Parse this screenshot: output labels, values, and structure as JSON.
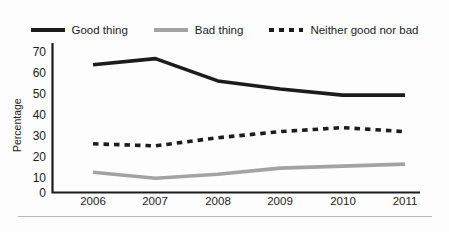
{
  "chart_data": {
    "type": "line",
    "title": "",
    "subtitle": "",
    "xlabel": "",
    "ylabel": "Percentage",
    "categories": [
      "2006",
      "2007",
      "2008",
      "2009",
      "2010",
      "2011"
    ],
    "x": [
      2006,
      2007,
      2008,
      2009,
      2010,
      2011
    ],
    "ylim": [
      0,
      70
    ],
    "xlim": [
      2006,
      2011
    ],
    "yticks": [
      0,
      10,
      20,
      30,
      40,
      50,
      60,
      70
    ],
    "ytick_labels": [
      "0",
      "10",
      "20",
      "30",
      "40",
      "50",
      "60",
      "70"
    ],
    "grid": false,
    "legend_position": "top",
    "series": [
      {
        "name": "Good thing",
        "values": [
          63,
          66,
          55,
          51,
          48,
          48
        ],
        "color": "#1c1c1c",
        "style": "solid",
        "width": 3.6
      },
      {
        "name": "Bad thing",
        "values": [
          10,
          7,
          9,
          12,
          13,
          14
        ],
        "color": "#a3a3a3",
        "style": "solid",
        "width": 3.6
      },
      {
        "name": "Neither good nor bad",
        "values": [
          24,
          23,
          27,
          30,
          32,
          30
        ],
        "color": "#1c1c1c",
        "style": "dashed",
        "width": 3.6
      }
    ]
  },
  "legend": {
    "items": [
      {
        "label": "Good thing",
        "swatch": "solid-dark"
      },
      {
        "label": "Bad thing",
        "swatch": "solid-gray"
      },
      {
        "label": "Neither good nor bad",
        "swatch": "dashed-dark"
      }
    ]
  },
  "axes": {
    "y_title": "Percentage",
    "y_ticks": [
      "70",
      "60",
      "50",
      "40",
      "30",
      "20",
      "10",
      "0"
    ],
    "x_ticks": [
      "2006",
      "2007",
      "2008",
      "2009",
      "2010",
      "2011"
    ]
  },
  "colors": {
    "series_dark": "#1c1c1c",
    "series_gray": "#a3a3a3",
    "axis": "#1c1c1c",
    "footer_rule": "#b9b9b9",
    "background": "#fdfdfd"
  }
}
